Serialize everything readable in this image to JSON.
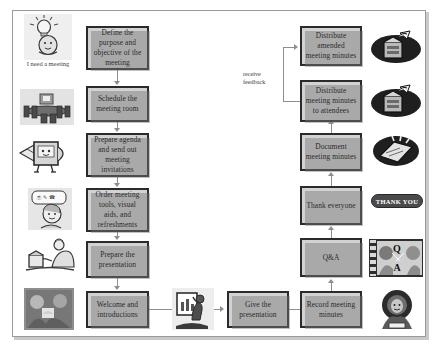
{
  "document": {
    "title": "Meeting Process Flowchart",
    "page_background": "#ffffff",
    "frame_border_color": "#9a9a9a",
    "box_fill_color": "#d2d2d2",
    "box_border_color": "#2b2b2b",
    "connector_color": "#8e8e8e"
  },
  "left_column": {
    "boxes": [
      {
        "id": "define-purpose",
        "label": "Define the purpose and objective of the meeting"
      },
      {
        "id": "schedule-room",
        "label": "Schedule the meeting room"
      },
      {
        "id": "prepare-agenda",
        "label": "Prepare agenda and send out meeting invitations"
      },
      {
        "id": "order-tools",
        "label": "Order meeting tools, visual aids, and refreshments"
      },
      {
        "id": "prepare-presentation",
        "label": "Prepare the presentation"
      },
      {
        "id": "welcome-introductions",
        "label": "Welcome and introductions"
      }
    ],
    "art": [
      {
        "id": "idea-lightbulb",
        "icon": "lightbulb-idea-icon",
        "caption": "I need a meeting"
      },
      {
        "id": "conference-room",
        "icon": "conference-room-icon",
        "caption": ""
      },
      {
        "id": "email-envelope",
        "icon": "email-envelope-icon",
        "caption": ""
      },
      {
        "id": "thinking-person",
        "icon": "thinking-person-icon",
        "caption": ""
      },
      {
        "id": "person-at-desk",
        "icon": "person-at-desk-icon",
        "caption": ""
      },
      {
        "id": "greeting-photo",
        "icon": "handshake-photo-icon",
        "caption": ""
      }
    ]
  },
  "center": {
    "box": {
      "id": "give-presentation",
      "label": "Give the presentation"
    },
    "art": {
      "id": "presenter",
      "icon": "presenter-easel-icon"
    }
  },
  "right_column": {
    "boxes": [
      {
        "id": "distribute-amended",
        "label": "Distribute amended meeting minutes"
      },
      {
        "id": "distribute-attendees",
        "label": "Distribute meeting minutes to attendees"
      },
      {
        "id": "document-minutes",
        "label": "Document meeting minutes"
      },
      {
        "id": "thank-everyone",
        "label": "Thank everyone"
      },
      {
        "id": "qa",
        "label": "Q&A"
      },
      {
        "id": "record-minutes",
        "label": "Record meeting minutes"
      }
    ],
    "art": [
      {
        "id": "mail-delivery-1",
        "icon": "mailbox-delivery-icon"
      },
      {
        "id": "mail-delivery-2",
        "icon": "mailbox-delivery-icon"
      },
      {
        "id": "notepad-writing",
        "icon": "notepad-pen-icon"
      },
      {
        "id": "thank-you-banner",
        "icon": "thank-you-banner-icon",
        "label": "THANK YOU"
      },
      {
        "id": "qa-people",
        "icon": "question-answer-people-icon",
        "question_letter": "Q",
        "answer_letter": "A"
      },
      {
        "id": "note-taker",
        "icon": "note-taker-icon"
      }
    ]
  },
  "annotations": {
    "feedback_label_line1": "receive",
    "feedback_label_line2": "feedback"
  }
}
